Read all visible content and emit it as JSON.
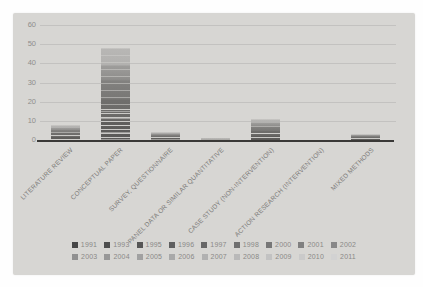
{
  "chart_data": {
    "type": "stacked-bar",
    "title": "",
    "categories": [
      "LITERATURE REVIEW",
      "CONCEPTUAL PAPER",
      "SURVEY, QUESTIONNAIRE",
      "PANEL DATA OR SIMILAR QUANTITATIVE",
      "CASE STUDY (NON-INTERVENTION)",
      "ACTION RESEARCH (INTERVENTION)",
      "MIXED METHODS"
    ],
    "totals": [
      8,
      48,
      4,
      1,
      11,
      0,
      3
    ],
    "legend_years": [
      "1991",
      "1993",
      "1995",
      "1996",
      "1997",
      "1998",
      "2000",
      "2001",
      "2002",
      "2003",
      "2004",
      "2005",
      "2006",
      "2007",
      "2008",
      "2009",
      "2010",
      "2011"
    ],
    "legend_rows": [
      9,
      9
    ],
    "legend_position": "bottom",
    "ylim": [
      0,
      60
    ],
    "yticks": [
      0,
      10,
      20,
      30,
      40,
      50,
      60
    ],
    "grid": true
  },
  "colors": {
    "photo_background": "#d7d6d3",
    "gridline": "#c3c2c0",
    "axis": "#3a3937",
    "y_label_text": "#8f8e8c",
    "x_label_text": "#7c7b79",
    "legend_text": "#8a8987",
    "bar_light": "#b8b7b5",
    "bar_dark": "#5a5957",
    "swatch_darkest": "#464646",
    "swatch_lightest": "#d2d2d2"
  }
}
